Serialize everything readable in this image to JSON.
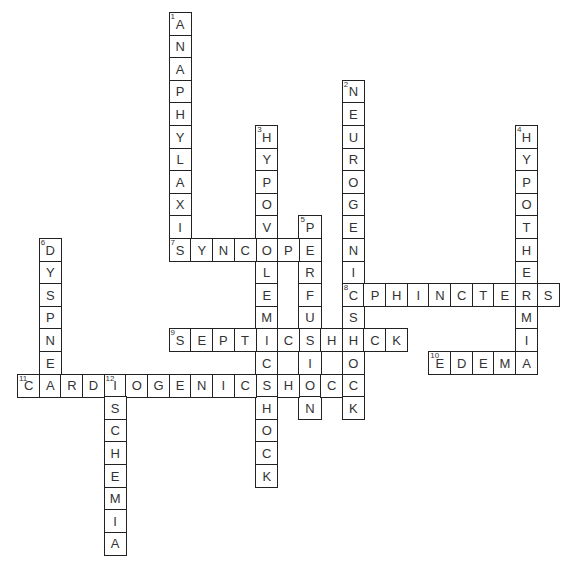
{
  "puzzle": {
    "cell_width": 21.65,
    "cell_height": 22.6,
    "origin_x": 17,
    "origin_y": 12,
    "words": [
      {
        "number": 1,
        "answer": "ANAPHYLAXIS",
        "direction": "down",
        "row": 0,
        "col": 7
      },
      {
        "number": 2,
        "answer": "NEUROGENICSHOCK",
        "direction": "down",
        "row": 3,
        "col": 15
      },
      {
        "number": 3,
        "answer": "HYPOVOLEMICSHOCK",
        "direction": "down",
        "row": 5,
        "col": 11
      },
      {
        "number": 4,
        "answer": "HYPOTHERMIA",
        "direction": "down",
        "row": 5,
        "col": 23
      },
      {
        "number": 5,
        "answer": "PERFUSION",
        "direction": "down",
        "row": 9,
        "col": 13
      },
      {
        "number": 6,
        "answer": "DYSPNEA",
        "direction": "down",
        "row": 10,
        "col": 1
      },
      {
        "number": 7,
        "answer": "SYNCOPE",
        "direction": "across",
        "row": 10,
        "col": 7
      },
      {
        "number": 8,
        "answer": "SPHINCTERS",
        "direction": "across",
        "row": 12,
        "col": 15
      },
      {
        "number": 9,
        "answer": "SEPTICSHOCK",
        "direction": "across",
        "row": 14,
        "col": 7
      },
      {
        "number": 10,
        "answer": "EDEMA",
        "direction": "across",
        "row": 15,
        "col": 19
      },
      {
        "number": 11,
        "answer": "CARDIOGENICSHOCK",
        "direction": "across",
        "row": 16,
        "col": 0
      },
      {
        "number": 12,
        "answer": "ISCHEMIA",
        "direction": "down",
        "row": 16,
        "col": 4
      }
    ]
  }
}
